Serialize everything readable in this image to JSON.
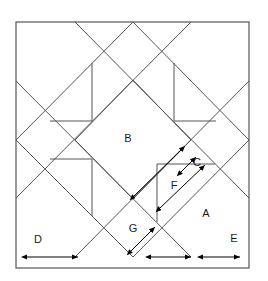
{
  "figure": {
    "background_color": "#ffffff",
    "line_color": "#555555",
    "arrow_color": "#000000",
    "label_color": "#1a1a1a",
    "frame": {
      "x": 16,
      "y": 22,
      "width": 233,
      "height": 246
    }
  },
  "labels": {
    "a": "A",
    "b": "B",
    "c": "C",
    "d": "D",
    "e": "E",
    "f": "F",
    "g": "G"
  },
  "label_positions": {
    "a": {
      "x": 206,
      "y": 214
    },
    "b": {
      "x": 128,
      "y": 139
    },
    "c": {
      "x": 197,
      "y": 163
    },
    "d": {
      "x": 38,
      "y": 240
    },
    "e": {
      "x": 234,
      "y": 239
    },
    "f": {
      "x": 174,
      "y": 186
    },
    "g": {
      "x": 133,
      "y": 229
    }
  },
  "geometry": {
    "outer_square": [
      {
        "x": 16,
        "y": 22
      },
      {
        "x": 249,
        "y": 22
      },
      {
        "x": 249,
        "y": 268
      },
      {
        "x": 16,
        "y": 268
      }
    ],
    "large_diamond": [
      {
        "x": 133,
        "y": 22
      },
      {
        "x": 249,
        "y": 140
      },
      {
        "x": 133,
        "y": 257
      },
      {
        "x": 16,
        "y": 140
      }
    ],
    "inner_diamond_b": [
      {
        "x": 133,
        "y": 80
      },
      {
        "x": 191,
        "y": 140
      },
      {
        "x": 133,
        "y": 199
      },
      {
        "x": 75,
        "y": 140
      }
    ],
    "corner_bands": [
      {
        "from": {
          "x": 75,
          "y": 22
        },
        "to": {
          "x": 249,
          "y": 198
        }
      },
      {
        "from": {
          "x": 16,
          "y": 81
        },
        "to": {
          "x": 191,
          "y": 257
        }
      },
      {
        "from": {
          "x": 191,
          "y": 22
        },
        "to": {
          "x": 16,
          "y": 198
        }
      },
      {
        "from": {
          "x": 249,
          "y": 81
        },
        "to": {
          "x": 75,
          "y": 257
        }
      }
    ],
    "pinwheel_squares": [
      {
        "x": 75,
        "y": 80,
        "size": 58
      },
      {
        "x": 133,
        "y": 80,
        "size": 58
      }
    ],
    "small_squares": [
      {
        "x": 133,
        "y": 140,
        "size": 58
      }
    ]
  },
  "dimension_arrows": {
    "horizontal": [
      {
        "name": "d-width",
        "x1": 27,
        "x2": 78,
        "y": 257
      },
      {
        "name": "g-a-width",
        "x1": 151,
        "x2": 191,
        "y": 257
      },
      {
        "name": "e-width",
        "x1": 203,
        "x2": 240,
        "y": 257
      }
    ],
    "diagonal": [
      {
        "name": "b-lower-right-edge",
        "x1": 134,
        "x2": 185,
        "y1": 196,
        "y2": 146
      },
      {
        "name": "c-short-edge",
        "x1": 181,
        "x2": 196,
        "y1": 172,
        "y2": 157
      },
      {
        "name": "f-a-edge",
        "x1": 160,
        "x2": 205,
        "y1": 208,
        "y2": 165
      },
      {
        "name": "g-edge",
        "x1": 131,
        "x2": 155,
        "y1": 251,
        "y2": 227
      }
    ]
  }
}
